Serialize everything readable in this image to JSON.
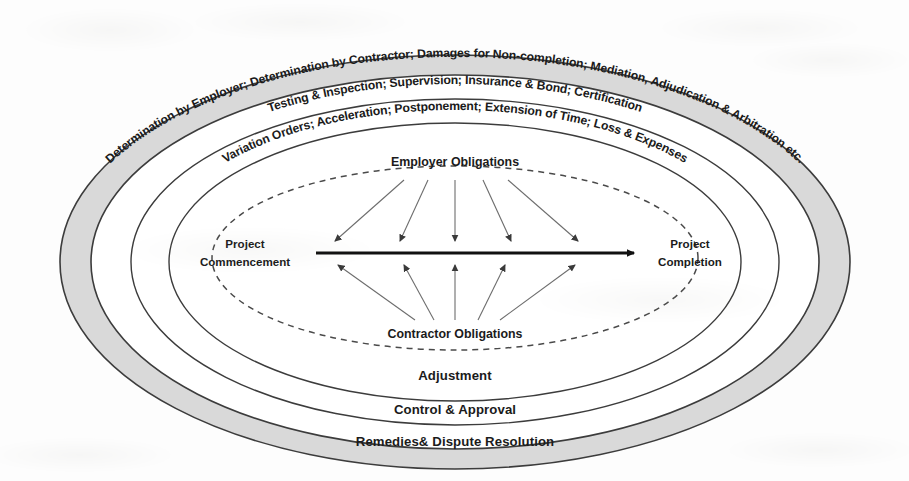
{
  "diagram": {
    "background_color": "#fdfdfd",
    "band_fill_gray": "#d9d9d9",
    "band_fill_white": "#ffffff",
    "stroke_color": "#3c3c3c",
    "rings": [
      {
        "id": "ring-outer",
        "fill": "gray",
        "top_label": "Determination by Employer; Determination by Contractor; Damages for Non-completion; Mediation, Adjudication & Arbitration etc.",
        "bottom_label": "Remedies& Dispute Resolution"
      },
      {
        "id": "ring-second",
        "fill": "white",
        "top_label": "Testing & Inspection; Supervision; Insurance & Bond; Certification",
        "bottom_label": "Control & Approval"
      },
      {
        "id": "ring-third",
        "fill": "white",
        "top_label": "Variation Orders; Acceleration; Postponement; Extension of Time; Loss & Expenses",
        "bottom_label": "Adjustment"
      }
    ],
    "core": {
      "id": "core-dashed-ellipse",
      "border_style": "dashed",
      "top_label": "Employer Obligations",
      "bottom_label": "Contractor Obligations",
      "start_label_line1": "Project",
      "start_label_line2": "Commencement",
      "end_label_line1": "Project",
      "end_label_line2": "Completion",
      "timeline_label": "Project timeline arrow",
      "employer_arrow_count": 5,
      "contractor_arrow_count": 5
    }
  }
}
